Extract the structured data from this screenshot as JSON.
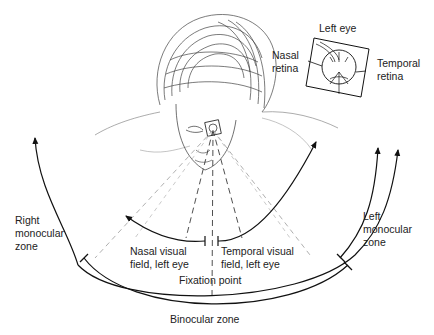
{
  "diagram": {
    "inset": {
      "title": "Left eye",
      "left_label_line1": "Nasal",
      "left_label_line2": "retina",
      "right_label_line1": "Temporal",
      "right_label_line2": "retina"
    },
    "labels": {
      "right_monocular_line1": "Right",
      "right_monocular_line2": "monocular",
      "right_monocular_line3": "zone",
      "left_monocular_line1": "Left",
      "left_monocular_line2": "monocular",
      "left_monocular_line3": "zone",
      "nasal_field_line1": "Nasal visual",
      "nasal_field_line2": "field, left eye",
      "temporal_field_line1": "Temporal visual",
      "temporal_field_line2": "field, left eye",
      "fixation_point": "Fixation point",
      "binocular_zone": "Binocular zone"
    },
    "colors": {
      "line": "#111111",
      "dashed_light": "#9a9a9a",
      "sketch": "#444444"
    }
  }
}
